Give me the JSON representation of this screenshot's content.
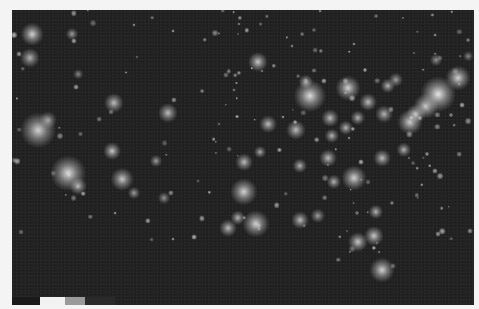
{
  "image": {
    "subject": "Night-time city lights over the contiguous United States",
    "background_color": "#232323",
    "light_color": "#e8e8e8"
  },
  "legend": {
    "segments": [
      {
        "color": "#1a1a1a",
        "width": 28
      },
      {
        "color": "#f2f2f2",
        "width": 25
      },
      {
        "color": "#9a9a9a",
        "width": 20
      },
      {
        "color": "#2a2a2a",
        "width": 30
      }
    ]
  },
  "lights": [
    {
      "name": "seattle",
      "x": 20,
      "y": 24,
      "r": 9,
      "a": 0.85
    },
    {
      "name": "portland",
      "x": 18,
      "y": 48,
      "r": 8,
      "a": 0.7
    },
    {
      "name": "spokane",
      "x": 60,
      "y": 24,
      "r": 5,
      "a": 0.6
    },
    {
      "name": "boise",
      "x": 66,
      "y": 64,
      "r": 4,
      "a": 0.5
    },
    {
      "name": "salt-lake-city",
      "x": 102,
      "y": 93,
      "r": 8,
      "a": 0.75
    },
    {
      "name": "denver",
      "x": 156,
      "y": 103,
      "r": 8,
      "a": 0.75
    },
    {
      "name": "sf-bay-area",
      "x": 26,
      "y": 120,
      "r": 14,
      "a": 0.85
    },
    {
      "name": "sacramento",
      "x": 36,
      "y": 110,
      "r": 7,
      "a": 0.6
    },
    {
      "name": "los-angeles",
      "x": 56,
      "y": 163,
      "r": 14,
      "a": 0.9
    },
    {
      "name": "san-diego",
      "x": 66,
      "y": 176,
      "r": 7,
      "a": 0.7
    },
    {
      "name": "las-vegas",
      "x": 100,
      "y": 141,
      "r": 7,
      "a": 0.8
    },
    {
      "name": "phoenix",
      "x": 110,
      "y": 169,
      "r": 9,
      "a": 0.8
    },
    {
      "name": "tucson",
      "x": 122,
      "y": 183,
      "r": 5,
      "a": 0.6
    },
    {
      "name": "albuquerque",
      "x": 144,
      "y": 151,
      "r": 5,
      "a": 0.6
    },
    {
      "name": "el-paso",
      "x": 152,
      "y": 188,
      "r": 5,
      "a": 0.55
    },
    {
      "name": "minneapolis",
      "x": 246,
      "y": 52,
      "r": 8,
      "a": 0.8
    },
    {
      "name": "chicago",
      "x": 298,
      "y": 86,
      "r": 13,
      "a": 0.9
    },
    {
      "name": "milwaukee",
      "x": 294,
      "y": 72,
      "r": 6,
      "a": 0.7
    },
    {
      "name": "detroit",
      "x": 336,
      "y": 78,
      "r": 10,
      "a": 0.85
    },
    {
      "name": "cleveland",
      "x": 356,
      "y": 92,
      "r": 7,
      "a": 0.75
    },
    {
      "name": "pittsburgh",
      "x": 372,
      "y": 104,
      "r": 7,
      "a": 0.7
    },
    {
      "name": "kansas-city",
      "x": 256,
      "y": 114,
      "r": 7,
      "a": 0.75
    },
    {
      "name": "st-louis",
      "x": 284,
      "y": 120,
      "r": 8,
      "a": 0.75
    },
    {
      "name": "indianapolis",
      "x": 318,
      "y": 108,
      "r": 7,
      "a": 0.75
    },
    {
      "name": "columbus",
      "x": 346,
      "y": 108,
      "r": 6,
      "a": 0.7
    },
    {
      "name": "cincinnati",
      "x": 334,
      "y": 118,
      "r": 6,
      "a": 0.7
    },
    {
      "name": "louisville",
      "x": 320,
      "y": 126,
      "r": 6,
      "a": 0.7
    },
    {
      "name": "nashville",
      "x": 316,
      "y": 148,
      "r": 7,
      "a": 0.75
    },
    {
      "name": "memphis",
      "x": 288,
      "y": 156,
      "r": 6,
      "a": 0.7
    },
    {
      "name": "atlanta",
      "x": 342,
      "y": 168,
      "r": 10,
      "a": 0.85
    },
    {
      "name": "charlotte",
      "x": 370,
      "y": 148,
      "r": 7,
      "a": 0.75
    },
    {
      "name": "raleigh",
      "x": 392,
      "y": 140,
      "r": 6,
      "a": 0.7
    },
    {
      "name": "birmingham",
      "x": 322,
      "y": 172,
      "r": 6,
      "a": 0.7
    },
    {
      "name": "oklahoma-city",
      "x": 232,
      "y": 152,
      "r": 7,
      "a": 0.75
    },
    {
      "name": "tulsa",
      "x": 248,
      "y": 142,
      "r": 5,
      "a": 0.65
    },
    {
      "name": "dallas",
      "x": 232,
      "y": 182,
      "r": 11,
      "a": 0.85
    },
    {
      "name": "austin",
      "x": 226,
      "y": 208,
      "r": 6,
      "a": 0.7
    },
    {
      "name": "san-antonio",
      "x": 216,
      "y": 218,
      "r": 7,
      "a": 0.75
    },
    {
      "name": "houston",
      "x": 244,
      "y": 214,
      "r": 11,
      "a": 0.85
    },
    {
      "name": "new-orleans",
      "x": 288,
      "y": 210,
      "r": 7,
      "a": 0.75
    },
    {
      "name": "gulf-coast",
      "x": 306,
      "y": 206,
      "r": 6,
      "a": 0.6
    },
    {
      "name": "jacksonville",
      "x": 364,
      "y": 202,
      "r": 6,
      "a": 0.7
    },
    {
      "name": "orlando",
      "x": 362,
      "y": 226,
      "r": 8,
      "a": 0.8
    },
    {
      "name": "tampa",
      "x": 346,
      "y": 232,
      "r": 8,
      "a": 0.8
    },
    {
      "name": "miami",
      "x": 370,
      "y": 260,
      "r": 10,
      "a": 0.85
    },
    {
      "name": "washington-dc",
      "x": 398,
      "y": 112,
      "r": 10,
      "a": 0.85
    },
    {
      "name": "baltimore",
      "x": 404,
      "y": 104,
      "r": 8,
      "a": 0.8
    },
    {
      "name": "philadelphia",
      "x": 414,
      "y": 96,
      "r": 10,
      "a": 0.85
    },
    {
      "name": "new-york",
      "x": 426,
      "y": 84,
      "r": 14,
      "a": 0.95
    },
    {
      "name": "boston",
      "x": 446,
      "y": 68,
      "r": 10,
      "a": 0.85
    },
    {
      "name": "buffalo",
      "x": 376,
      "y": 76,
      "r": 6,
      "a": 0.7
    },
    {
      "name": "toronto-edge",
      "x": 384,
      "y": 70,
      "r": 6,
      "a": 0.6
    },
    {
      "name": "montreal-edge",
      "x": 424,
      "y": 50,
      "r": 5,
      "a": 0.55
    },
    {
      "name": "maine",
      "x": 456,
      "y": 46,
      "r": 4,
      "a": 0.5
    }
  ]
}
